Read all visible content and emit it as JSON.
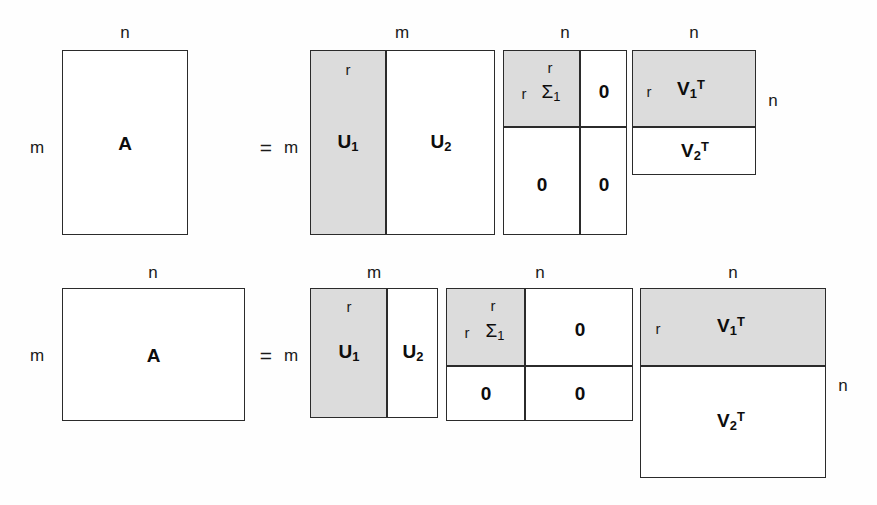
{
  "figure": {
    "colors": {
      "shaded_block": "#dcdcdc",
      "border": "#2b2b2b",
      "background": "#ffffff",
      "text": "#1a1a1a"
    },
    "equation": "A = U Σ V^T",
    "symbols": {
      "equals": "=",
      "dim_m": "m",
      "dim_n": "n",
      "rank_r": "r",
      "zero": "0"
    }
  },
  "rows": [
    {
      "id": "tall-case",
      "description": "Tall matrix case, m greater than n",
      "matrices": [
        {
          "id": "A-tall",
          "name": "A",
          "top_label": "n",
          "left_label": "m",
          "blocks": [
            {
              "label": "A",
              "shaded": false
            }
          ]
        },
        {
          "id": "U-tall",
          "name": "U",
          "top_label": "m",
          "left_label": "m",
          "inner_top_label": "r",
          "blocks": [
            {
              "label": "U",
              "sub": "1",
              "shaded": true
            },
            {
              "label": "U",
              "sub": "2",
              "shaded": false
            }
          ]
        },
        {
          "id": "Sigma-tall",
          "name": "Sigma",
          "top_label": "n",
          "inner_top_label": "r",
          "inner_left_label": "r",
          "blocks": [
            {
              "label": "Σ",
              "sub": "1",
              "shaded": true
            },
            {
              "label": "0",
              "shaded": false
            },
            {
              "label": "0",
              "shaded": false
            },
            {
              "label": "0",
              "shaded": false
            }
          ]
        },
        {
          "id": "VT-tall",
          "name": "V transpose",
          "top_label": "n",
          "right_label": "n",
          "inner_left_label": "r",
          "blocks": [
            {
              "label": "V",
              "sub": "1",
              "sup": "T",
              "shaded": true
            },
            {
              "label": "V",
              "sub": "2",
              "sup": "T",
              "shaded": false
            }
          ]
        }
      ]
    },
    {
      "id": "wide-case",
      "description": "Wide matrix case, m less than n",
      "matrices": [
        {
          "id": "A-wide",
          "name": "A",
          "top_label": "n",
          "left_label": "m",
          "blocks": [
            {
              "label": "A",
              "shaded": false
            }
          ]
        },
        {
          "id": "U-wide",
          "name": "U",
          "top_label": "m",
          "left_label": "m",
          "inner_top_label": "r",
          "blocks": [
            {
              "label": "U",
              "sub": "1",
              "shaded": true
            },
            {
              "label": "U",
              "sub": "2",
              "shaded": false
            }
          ]
        },
        {
          "id": "Sigma-wide",
          "name": "Sigma",
          "top_label": "n",
          "inner_top_label": "r",
          "inner_left_label": "r",
          "blocks": [
            {
              "label": "Σ",
              "sub": "1",
              "shaded": true
            },
            {
              "label": "0",
              "shaded": false
            },
            {
              "label": "0",
              "shaded": false
            },
            {
              "label": "0",
              "shaded": false
            }
          ]
        },
        {
          "id": "VT-wide",
          "name": "V transpose",
          "top_label": "n",
          "right_label": "n",
          "inner_left_label": "r",
          "blocks": [
            {
              "label": "V",
              "sub": "1",
              "sup": "T",
              "shaded": true
            },
            {
              "label": "V",
              "sub": "2",
              "sup": "T",
              "shaded": false
            }
          ]
        }
      ]
    }
  ],
  "labels": {
    "row1": {
      "a_top_n": "n",
      "a_left_m": "m",
      "a_name": "A",
      "equals": "=",
      "u_left_m": "m",
      "u_top_m": "m",
      "u_inner_r": "r",
      "u1": "U",
      "u1_sub": "1",
      "u2": "U",
      "u2_sub": "2",
      "s_top_n": "n",
      "s_inner_top_r": "r",
      "s_inner_left_r": "r",
      "sigma": "Σ",
      "sigma_sub": "1",
      "zero_tr": "0",
      "zero_bl": "0",
      "zero_br": "0",
      "v_top_n": "n",
      "v_right_n": "n",
      "v_inner_r": "r",
      "v1": "V",
      "v1_sub": "1",
      "v1_sup": "T",
      "v2": "V",
      "v2_sub": "2",
      "v2_sup": "T"
    },
    "row2": {
      "a_top_n": "n",
      "a_left_m": "m",
      "a_name": "A",
      "equals": "=",
      "u_left_m": "m",
      "u_top_m": "m",
      "u_inner_r": "r",
      "u1": "U",
      "u1_sub": "1",
      "u2": "U",
      "u2_sub": "2",
      "s_top_n": "n",
      "s_inner_top_r": "r",
      "s_inner_left_r": "r",
      "sigma": "Σ",
      "sigma_sub": "1",
      "zero_tr": "0",
      "zero_bl": "0",
      "zero_br": "0",
      "v_top_n": "n",
      "v_right_n": "n",
      "v_inner_r": "r",
      "v1": "V",
      "v1_sub": "1",
      "v1_sup": "T",
      "v2": "V",
      "v2_sub": "2",
      "v2_sup": "T"
    }
  }
}
